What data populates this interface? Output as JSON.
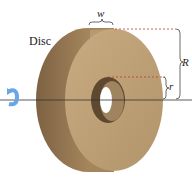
{
  "diagram": {
    "title_label": "Disc",
    "width_label": "w",
    "outer_radius_label": "R",
    "inner_radius_label": "r",
    "rotation_icon": "rotation-arrow-icon",
    "colors": {
      "disc_face": "#bfa077",
      "disc_rim": "#9a7b55",
      "disc_shadow": "#7d6243",
      "hole": "#5e4830",
      "hole_inner": "#a08460",
      "dashed": "#c0392b",
      "axis": "#333333",
      "arrow": "#6aa5e8"
    }
  }
}
